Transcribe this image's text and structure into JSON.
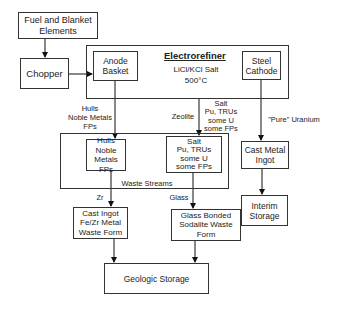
{
  "diagram": {
    "nodes": {
      "fuel": "Fuel and Blanket\nElements",
      "chopper": "Chopper",
      "electrorefiner_title": "Electrorefiner",
      "electrorefiner_desc": "LiCl/KCl Salt\n500°C",
      "anode": "Anode\nBasket",
      "cathode": "Steel\nCathode",
      "hulls": "Hulls\nNoble Metals\nFPs",
      "salt": "Salt\nPu, TRUs\nsome U\nsome FPs",
      "cast_metal": "Cast Metal\nIngot",
      "interim": "Interim\nStorage",
      "cast_ingot": "Cast Ingot\nFe/Zr Metal\nWaste Form",
      "glass": "Glass Bonded\nSodalite Waste\nForm",
      "geologic": "Geologic Storage"
    },
    "group_label": "Waste Streams",
    "edge_labels": {
      "hulls_flow": "Hulls\nNoble Metals\nFPs",
      "zeolite": "Zeolite",
      "salt_flow": "Salt\nPu, TRUs\nsome U\nsome FPs",
      "uranium": "\"Pure\" Uranium",
      "zr": "Zr",
      "glass": "Glass"
    }
  }
}
